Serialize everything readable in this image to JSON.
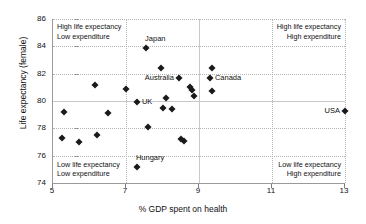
{
  "chart_data": {
    "type": "scatter",
    "title": "",
    "xlabel": "% GDP spent on health",
    "ylabel": "Life expectancy (female)",
    "xlim": [
      5,
      13
    ],
    "ylim": [
      74,
      86
    ],
    "xticks": [
      5,
      7,
      9,
      11,
      13
    ],
    "yticks": [
      74,
      76,
      78,
      80,
      82,
      84,
      86
    ],
    "grid": true,
    "legend": "none",
    "quadrant_x": 9,
    "quadrant_y": 80,
    "annotations": [
      {
        "name": "top-left-note",
        "line1": "High life expectancy",
        "line2": "Low expenditure"
      },
      {
        "name": "top-right-note",
        "line1": "High life expectancy",
        "line2": "High expenditure"
      },
      {
        "name": "bottom-left-note",
        "line1": "Low life expectancy",
        "line2": "Low expenditure"
      },
      {
        "name": "bottom-right-note",
        "line1": "Low life expectancy",
        "line2": "High expenditure"
      }
    ],
    "points": [
      {
        "label": "",
        "x": 5.3,
        "y": 79.2
      },
      {
        "label": "",
        "x": 5.25,
        "y": 77.3
      },
      {
        "label": "",
        "x": 5.7,
        "y": 77.0
      },
      {
        "label": "",
        "x": 6.2,
        "y": 77.5
      },
      {
        "label": "",
        "x": 6.15,
        "y": 81.2
      },
      {
        "label": "",
        "x": 6.5,
        "y": 79.15
      },
      {
        "label": "",
        "x": 7.0,
        "y": 80.9
      },
      {
        "label": "UK",
        "x": 7.3,
        "y": 79.9,
        "label_pos": "right"
      },
      {
        "label": "Hungary",
        "x": 7.3,
        "y": 75.2,
        "label_pos": "above"
      },
      {
        "label": "Japan",
        "x": 7.55,
        "y": 83.85,
        "label_pos": "above"
      },
      {
        "label": "",
        "x": 7.6,
        "y": 78.1
      },
      {
        "label": "",
        "x": 7.95,
        "y": 82.4
      },
      {
        "label": "",
        "x": 8.0,
        "y": 79.5
      },
      {
        "label": "",
        "x": 8.1,
        "y": 80.25
      },
      {
        "label": "",
        "x": 8.25,
        "y": 79.4
      },
      {
        "label": "Australia",
        "x": 8.45,
        "y": 81.65,
        "label_pos": "left"
      },
      {
        "label": "",
        "x": 8.5,
        "y": 77.2
      },
      {
        "label": "",
        "x": 8.6,
        "y": 77.1
      },
      {
        "label": "",
        "x": 8.75,
        "y": 81.0
      },
      {
        "label": "",
        "x": 8.8,
        "y": 80.8
      },
      {
        "label": "",
        "x": 8.85,
        "y": 80.4
      },
      {
        "label": "Canada",
        "x": 9.3,
        "y": 81.65,
        "label_pos": "right"
      },
      {
        "label": "",
        "x": 9.35,
        "y": 82.45
      },
      {
        "label": "",
        "x": 9.35,
        "y": 80.7
      },
      {
        "label": "USA",
        "x": 13.0,
        "y": 79.3,
        "label_pos": "left"
      }
    ]
  }
}
